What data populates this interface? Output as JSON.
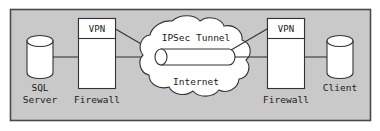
{
  "diagram": {
    "frame": {
      "fill": "#c9c9c9",
      "stroke": "#4a4a4a"
    },
    "colors": {
      "shape_fill": "#ffffff",
      "shape_stroke": "#333333",
      "line": "#333333",
      "text": "#1a1a1a",
      "canvas": "#ffffff"
    },
    "nodes": [
      {
        "id": "sql-server",
        "shape": "cylinder",
        "label_line1": "SQL",
        "label_line2": "Server"
      },
      {
        "id": "firewall-left",
        "shape": "rectangle",
        "label": "Firewall",
        "module_label": "VPN"
      },
      {
        "id": "internet-cloud",
        "shape": "cloud",
        "label": "Internet",
        "tunnel_label": "IPSec Tunnel",
        "tunnel_shape": "cylinder"
      },
      {
        "id": "firewall-right",
        "shape": "rectangle",
        "label": "Firewall",
        "module_label": "VPN"
      },
      {
        "id": "client",
        "shape": "cylinder",
        "label": "Client"
      }
    ],
    "connections": [
      {
        "from": "sql-server",
        "to": "firewall-left",
        "style": "solid"
      },
      {
        "from": "firewall-left",
        "to": "internet-cloud",
        "style": "solid"
      },
      {
        "from": "firewall-left-vpn",
        "to": "tunnel-left-end",
        "style": "solid-diagonal"
      },
      {
        "from": "internet-cloud",
        "to": "firewall-right",
        "style": "solid"
      },
      {
        "from": "tunnel-right-end",
        "to": "firewall-right-vpn",
        "style": "solid-diagonal"
      },
      {
        "from": "firewall-right",
        "to": "client",
        "style": "solid"
      }
    ]
  }
}
